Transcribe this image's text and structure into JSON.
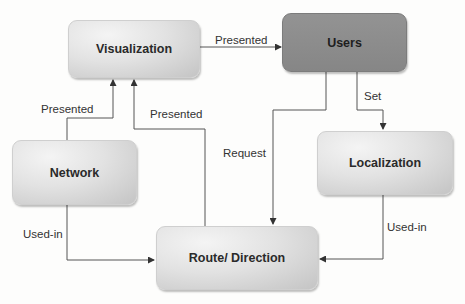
{
  "diagram": {
    "type": "flowchart",
    "nodes": [
      {
        "id": "visualization",
        "label": "Visualization"
      },
      {
        "id": "users",
        "label": "Users"
      },
      {
        "id": "network",
        "label": "Network"
      },
      {
        "id": "localization",
        "label": "Localization"
      },
      {
        "id": "route",
        "label": "Route/ Direction"
      }
    ],
    "edges": [
      {
        "from": "visualization",
        "to": "users",
        "label": "Presented"
      },
      {
        "from": "network",
        "to": "visualization",
        "label": "Presented"
      },
      {
        "from": "route",
        "to": "visualization",
        "label": "Presented"
      },
      {
        "from": "users",
        "to": "route",
        "label": "Request"
      },
      {
        "from": "users",
        "to": "localization",
        "label": "Set"
      },
      {
        "from": "network",
        "to": "route",
        "label": "Used-in"
      },
      {
        "from": "localization",
        "to": "route",
        "label": "Used-in"
      }
    ]
  },
  "colors": {
    "node_light": "#e2e2e2",
    "node_dark": "#8d8d8d",
    "edge": "#555555"
  }
}
